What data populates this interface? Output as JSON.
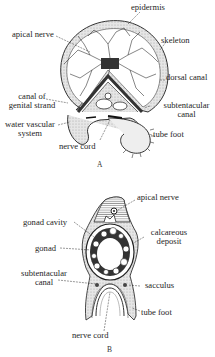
{
  "figures": [
    {
      "id": "A",
      "caption": "A",
      "labels": {
        "epidermis": "epidermis",
        "apical_nerve": "apical nerve",
        "skeleton": "skeleton",
        "dorsal_canal": "dorsal canal",
        "canal_of_genital_strand_1": "canal of",
        "canal_of_genital_strand_2": "genital strand",
        "subtentacular_canal_1": "subtentacular",
        "subtentacular_canal_2": "canal",
        "water_vascular_system_1": "water vascular",
        "water_vascular_system_2": "system",
        "tube_foot": "tube foot",
        "nerve_cord": "nerve cord"
      }
    },
    {
      "id": "B",
      "caption": "B",
      "labels": {
        "apical_nerve": "apical nerve",
        "gonad_cavity": "gonad cavity",
        "calcareous_deposit_1": "calcareous",
        "calcareous_deposit_2": "deposit",
        "gonad": "gonad",
        "subtentacular_canal_1": "subtentacular",
        "subtentacular_canal_2": "canal",
        "sacculus": "sacculus",
        "tube_foot": "tube foot",
        "nerve_cord": "nerve cord"
      }
    }
  ],
  "colors": {
    "ink": "#1e1e1e",
    "stipple": "#cfcfcf",
    "background": "#ffffff"
  }
}
